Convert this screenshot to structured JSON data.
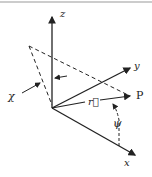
{
  "labels": {
    "z_top": "z",
    "y": "y",
    "chi": "χ",
    "r": "r⃗",
    "P": "P",
    "psi": "ψ",
    "x_bottom": "x"
  },
  "colors": {
    "ink": "#222222"
  }
}
